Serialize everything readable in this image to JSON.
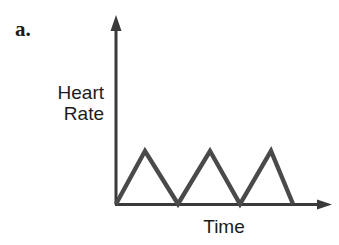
{
  "figure": {
    "panel_label": "a.",
    "background_color": "#ffffff",
    "line_color": "#4a4a4a",
    "axis_color": "#3a3a3a",
    "text_color": "#1c1c1c"
  },
  "labels": {
    "y_axis_line1": "Heart",
    "y_axis_line2": "Rate",
    "x_axis": "Time"
  },
  "icons": {
    "y_axis_arrow": "arrow-up-icon",
    "x_axis_arrow": "arrow-right-icon"
  },
  "chart_data": {
    "type": "line",
    "title": "",
    "subtitle": "",
    "xlabel": "Time",
    "ylabel": "Heart Rate",
    "grid": false,
    "legend": "none",
    "axes": {
      "x_ticks": [],
      "y_ticks": [],
      "x_tick_labels": [],
      "y_tick_labels": [],
      "xlim": [
        0,
        10
      ],
      "ylim": [
        0,
        4
      ],
      "x_arrow": true,
      "y_arrow": true
    },
    "annotations": [
      {
        "text": "a.",
        "role": "panel-label"
      }
    ],
    "series": [
      {
        "name": "Heart Rate",
        "description": "Triangle wave: three identical symmetric peaks rising from and returning to baseline",
        "color": "#4a4a4a",
        "line_width": 4,
        "x": [
          0,
          1.0,
          2.0,
          3.0,
          4.0,
          5.0,
          6.0
        ],
        "y": [
          0,
          3,
          0,
          3,
          0,
          3,
          0
        ]
      }
    ],
    "pixel_path": [
      {
        "x": 116,
        "y": 204
      },
      {
        "x": 145,
        "y": 151
      },
      {
        "x": 178,
        "y": 204
      },
      {
        "x": 210,
        "y": 151
      },
      {
        "x": 240,
        "y": 204
      },
      {
        "x": 271,
        "y": 151
      },
      {
        "x": 293,
        "y": 204
      }
    ],
    "geometry": {
      "origin_px": [
        116,
        204
      ],
      "y_axis_top_px": [
        116,
        17
      ],
      "x_axis_right_px": [
        331,
        204
      ],
      "peak_count": 3,
      "peak_height_px": 53
    }
  }
}
